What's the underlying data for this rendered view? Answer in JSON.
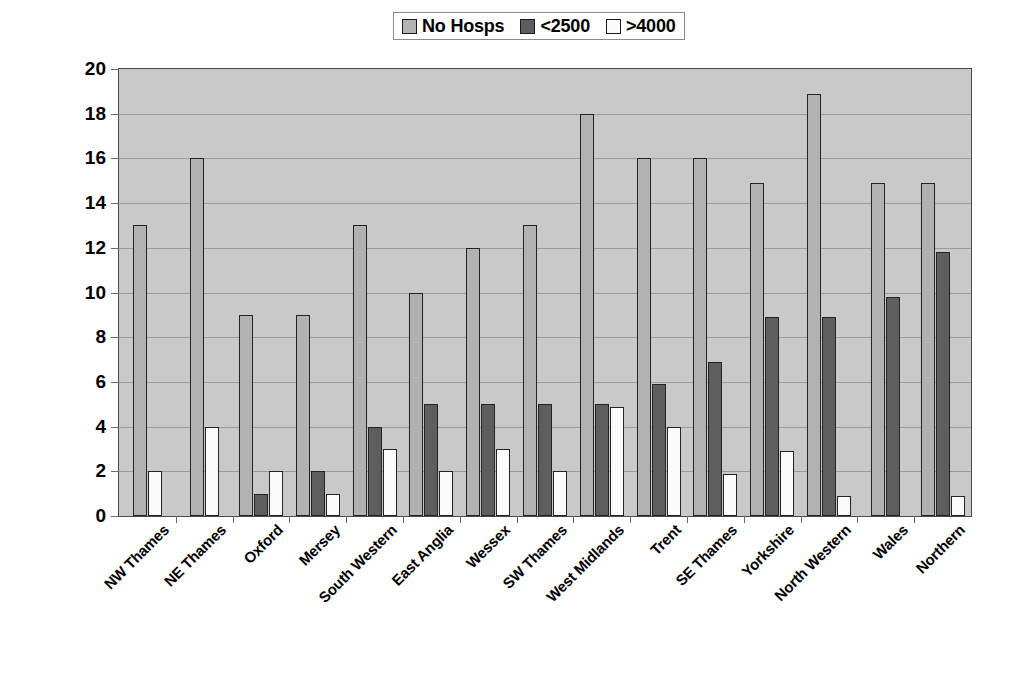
{
  "chart_data": {
    "type": "bar",
    "title": "",
    "xlabel": "",
    "ylabel": "",
    "ylim": [
      0,
      20
    ],
    "ytick_step": 2,
    "yticks": [
      20,
      18,
      16,
      14,
      12,
      10,
      8,
      6,
      4,
      2,
      0
    ],
    "grid": true,
    "legend_position": "top-center",
    "categories": [
      "NW Thames",
      "NE Thames",
      "Oxford",
      "Mersey",
      "South Western",
      "East Anglia",
      "Wessex",
      "SW Thames",
      "West Midlands",
      "Trent",
      "SE Thames",
      "Yorkshire",
      "North Western",
      "Wales",
      "Northern"
    ],
    "series": [
      {
        "name": "No Hosps",
        "color": "#b2b2b2",
        "values": [
          13,
          16,
          9,
          9,
          13,
          10,
          12,
          13,
          18,
          16,
          16,
          14.9,
          18.9,
          14.9,
          14.9
        ]
      },
      {
        "name": "<2500",
        "color": "#5e5e5e",
        "values": [
          0,
          0,
          1,
          2,
          4,
          5,
          5,
          5,
          5,
          5.9,
          6.9,
          8.9,
          8.9,
          9.8,
          11.8
        ]
      },
      {
        "name": ">4000",
        "color": "#fbfbfb",
        "values": [
          2,
          4,
          2,
          1,
          3,
          2,
          3,
          2,
          4.9,
          4,
          1.9,
          2.9,
          0.9,
          0,
          0.9
        ]
      }
    ]
  },
  "colors": {
    "plot_background": "#c9c9c9",
    "gridline": "#9a9a9a",
    "axis": "#4a4a4a",
    "bar_border": "#232323",
    "text": "#000000"
  }
}
